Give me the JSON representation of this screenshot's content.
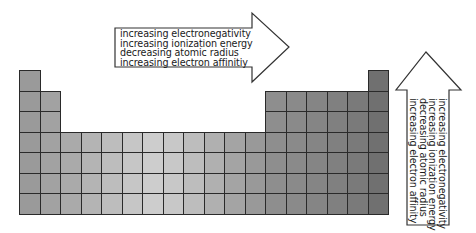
{
  "diagram": {
    "table": {
      "columns": 18,
      "rows": 7,
      "origin_x": 19,
      "origin_y": 70,
      "cell_size": 20.5,
      "layout": [
        [
          1,
          0,
          0,
          0,
          0,
          0,
          0,
          0,
          0,
          0,
          0,
          0,
          0,
          0,
          0,
          0,
          0,
          1
        ],
        [
          1,
          1,
          0,
          0,
          0,
          0,
          0,
          0,
          0,
          0,
          0,
          0,
          1,
          1,
          1,
          1,
          1,
          1
        ],
        [
          1,
          1,
          0,
          0,
          0,
          0,
          0,
          0,
          0,
          0,
          0,
          0,
          1,
          1,
          1,
          1,
          1,
          1
        ],
        [
          1,
          1,
          1,
          1,
          1,
          1,
          1,
          1,
          1,
          1,
          1,
          1,
          1,
          1,
          1,
          1,
          1,
          1
        ],
        [
          1,
          1,
          1,
          1,
          1,
          1,
          1,
          1,
          1,
          1,
          1,
          1,
          1,
          1,
          1,
          1,
          1,
          1
        ],
        [
          1,
          1,
          1,
          1,
          1,
          1,
          1,
          1,
          1,
          1,
          1,
          1,
          1,
          1,
          1,
          1,
          1,
          1
        ],
        [
          1,
          1,
          1,
          1,
          1,
          1,
          1,
          1,
          1,
          1,
          1,
          1,
          1,
          1,
          1,
          1,
          1,
          1
        ]
      ],
      "column_shades": [
        "#9a9a9a",
        "#a2a2a2",
        "#aaaaaa",
        "#b4b4b4",
        "#bdbdbd",
        "#c6c6c6",
        "#cdcdcd",
        "#c8c8c8",
        "#bdbdbd",
        "#b0b0b0",
        "#a4a4a4",
        "#999999",
        "#8e8e8e",
        "#8a8a8a",
        "#858585",
        "#808080",
        "#7a7a7a",
        "#707070"
      ],
      "line_color": "#2a2a2a"
    },
    "horizontal_arrow": {
      "direction": "right",
      "labels": [
        "increasing electronegativity",
        "increasing ionization energy",
        "decreasing atomic radius",
        "increasing electron affinitiy"
      ]
    },
    "vertical_arrow": {
      "direction": "up",
      "labels": [
        "increasing electronegativity",
        "increasing ionization energy",
        "decreasing atomic radius",
        "increasing electron affinity"
      ]
    }
  }
}
